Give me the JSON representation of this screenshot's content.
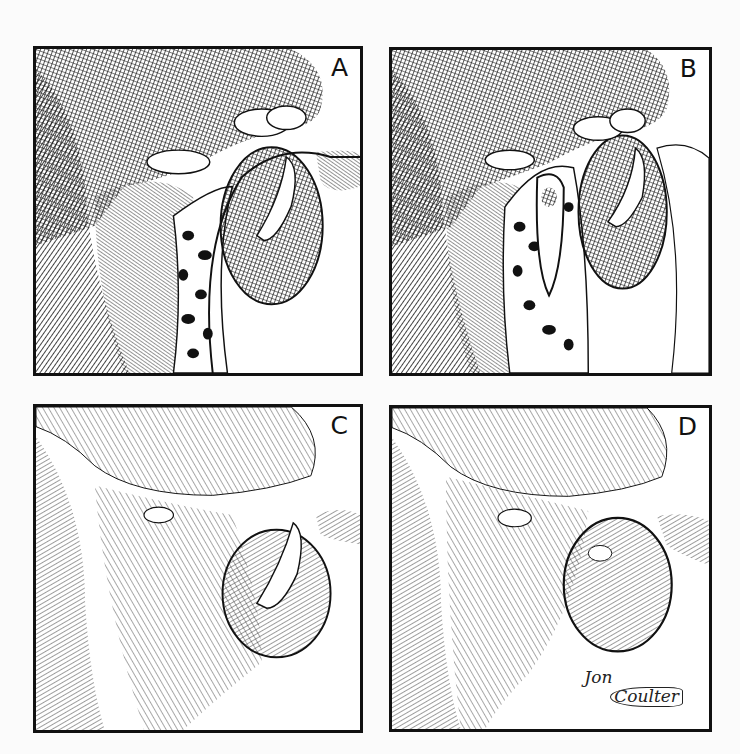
{
  "figure": {
    "type": "four-panel pen-and-ink scientific illustration",
    "layout": "2x2 grid",
    "panels": [
      {
        "id": "A",
        "label": "A",
        "style": "dark crosshatched with mottled/spotted pattern"
      },
      {
        "id": "B",
        "label": "B",
        "style": "dark crosshatched with mottled/spotted pattern, inner fold visible"
      },
      {
        "id": "C",
        "label": "C",
        "style": "light contour hatching, opening with tongue-like structure"
      },
      {
        "id": "D",
        "label": "D",
        "style": "light contour hatching, closed rounded protrusion"
      }
    ],
    "signature": {
      "first": "Jon",
      "last": "Coulter"
    },
    "colors": {
      "ink": "#111111",
      "paper": "#ffffff",
      "background": "#fbfbfb"
    }
  }
}
